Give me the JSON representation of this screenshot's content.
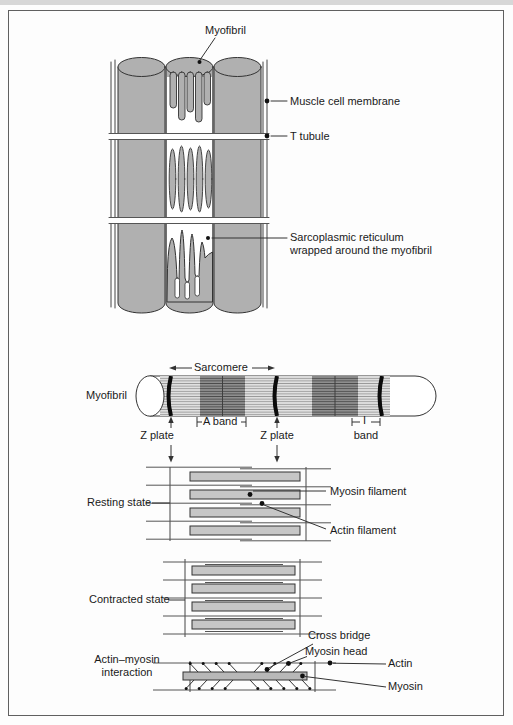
{
  "figure": {
    "type": "muscle-structure-diagram",
    "labels": {
      "myofibril_top": "Myofibril",
      "muscle_cell_membrane": "Muscle cell membrane",
      "t_tubule": "T tubule",
      "sarcoplasmic_reticulum": "Sarcoplasmic reticulum wrapped around the myofibril",
      "sarcomere": "Sarcomere",
      "myofibril_side": "Myofibril",
      "a_band": "A band",
      "z_plate_left": "Z plate",
      "z_plate_right": "Z plate",
      "i_band_letter": "I",
      "i_band_word": "band",
      "resting_state": "Resting state",
      "myosin_filament": "Myosin filament",
      "actin_filament": "Actin filament",
      "contracted_state": "Contracted state",
      "cross_bridge": "Cross bridge",
      "myosin_head": "Myosin head",
      "actin": "Actin",
      "myosin": "Myosin",
      "actin_myosin_interaction": "Actin–myosin interaction"
    },
    "colors": {
      "cylinder_gray": "#b0b0b0",
      "light_band": "#e2e2e2",
      "dark_band": "#8f8f8f",
      "filament_bar": "#c6c6c6",
      "line": "#333333",
      "z_plate_black": "#0b0b0b",
      "background": "#fdfdfd"
    }
  }
}
